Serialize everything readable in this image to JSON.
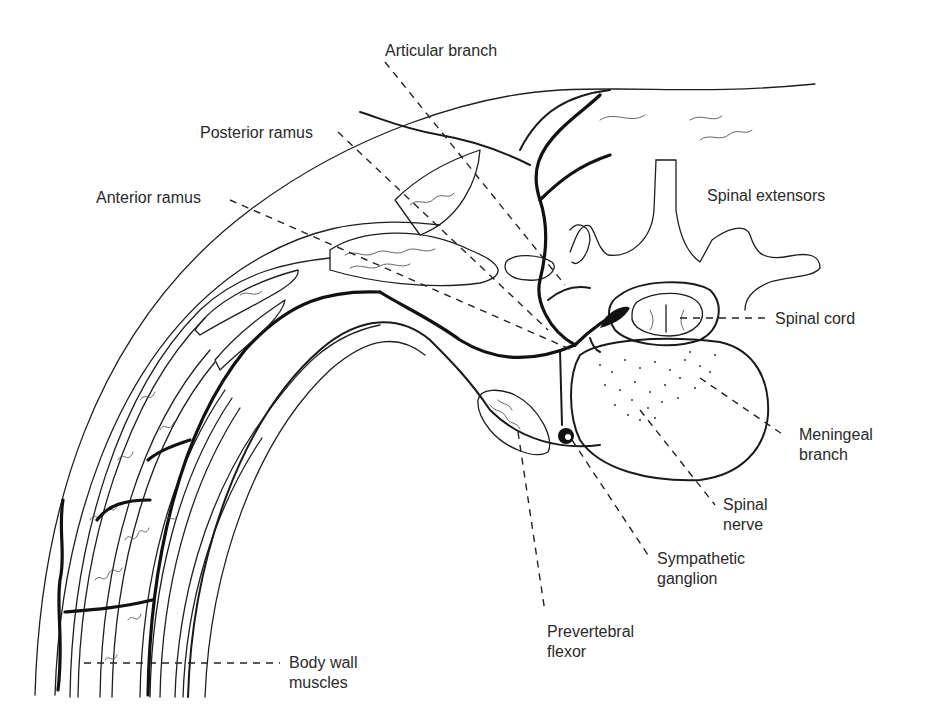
{
  "figure": {
    "type": "anatomical cross-section illustration"
  },
  "labels": [
    {
      "id": "articular-branch",
      "lines": [
        "Articular branch"
      ],
      "x": 385,
      "y": 56,
      "anchor": "start",
      "leader": [
        [
          385,
          62
        ],
        [
          565,
          285
        ]
      ]
    },
    {
      "id": "posterior-ramus",
      "lines": [
        "Posterior ramus"
      ],
      "x": 200,
      "y": 138,
      "anchor": "start",
      "leader": [
        [
          338,
          132
        ],
        [
          548,
          330
        ]
      ]
    },
    {
      "id": "anterior-ramus",
      "lines": [
        "Anterior ramus"
      ],
      "x": 96,
      "y": 203,
      "anchor": "start",
      "leader": [
        [
          230,
          200
        ],
        [
          572,
          350
        ]
      ]
    },
    {
      "id": "spinal-extensors",
      "lines": [
        "Spinal extensors"
      ],
      "x": 707,
      "y": 201,
      "anchor": "start",
      "leader": null
    },
    {
      "id": "spinal-cord",
      "lines": [
        "Spinal cord"
      ],
      "x": 775,
      "y": 324,
      "anchor": "start",
      "leader": [
        [
          680,
          318
        ],
        [
          770,
          318
        ]
      ]
    },
    {
      "id": "meningeal-branch",
      "lines": [
        "Meningeal",
        "branch"
      ],
      "x": 799,
      "y": 440,
      "anchor": "start",
      "leader": [
        [
          700,
          378
        ],
        [
          785,
          436
        ]
      ]
    },
    {
      "id": "spinal-nerve",
      "lines": [
        "Spinal",
        "nerve"
      ],
      "x": 723,
      "y": 510,
      "anchor": "start",
      "leader": [
        [
          640,
          410
        ],
        [
          715,
          505
        ]
      ]
    },
    {
      "id": "sympathetic-ganglion",
      "lines": [
        "Sympathetic",
        "ganglion"
      ],
      "x": 657,
      "y": 564,
      "anchor": "start",
      "leader": [
        [
          572,
          440
        ],
        [
          650,
          558
        ]
      ]
    },
    {
      "id": "prevertebral-flexor",
      "lines": [
        "Prevertebral",
        "flexor"
      ],
      "x": 547,
      "y": 637,
      "anchor": "start",
      "leader": [
        [
          518,
          432
        ],
        [
          545,
          612
        ]
      ]
    },
    {
      "id": "body-wall-muscles",
      "lines": [
        "Body wall",
        "muscles"
      ],
      "x": 289,
      "y": 668,
      "anchor": "start",
      "leader": [
        [
          84,
          663
        ],
        [
          280,
          663
        ]
      ]
    }
  ],
  "structures": [
    "skin",
    "spinal-extensor-muscles",
    "vertebra",
    "spinal-cord",
    "vertebral-body",
    "spinal-nerve",
    "posterior-ramus",
    "anterior-ramus",
    "articular-branch",
    "meningeal-branch",
    "sympathetic-ganglion",
    "prevertebral-flexor",
    "body-wall-muscles"
  ]
}
